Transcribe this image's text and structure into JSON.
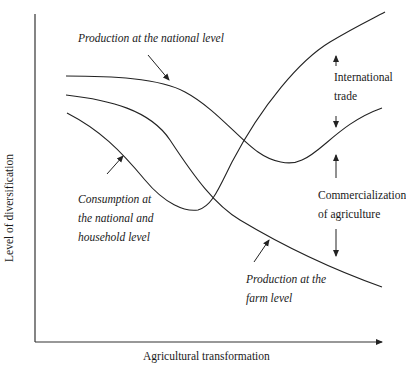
{
  "diagram": {
    "axes": {
      "x_label": "Agricultural transformation",
      "y_label": "Level of diversification"
    },
    "curves": [
      {
        "name": "Production at the national level",
        "shape": "flat then declining to a trough, then rising"
      },
      {
        "name": "Production at the farm level",
        "shape": "continuously declining"
      },
      {
        "name": "Consumption at the national and household level",
        "shape": "declining to a trough, then rising steeply"
      }
    ],
    "labels": {
      "national_production": "Production at the national level",
      "consumption": [
        "Consumption  at",
        "the national and",
        "household level"
      ],
      "farm_production": [
        "Production at the",
        "farm level"
      ],
      "international_trade": [
        "International",
        "trade"
      ],
      "commercialization": [
        "Commercialization",
        "of agriculture"
      ]
    },
    "colors": {
      "line": "#222222",
      "background": "#ffffff"
    }
  }
}
